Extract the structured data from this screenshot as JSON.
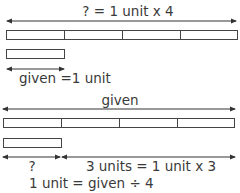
{
  "top_model": {
    "total_label": "? = 1 unit x 4",
    "units": 4,
    "unit_label": "given =1 unit"
  },
  "bottom_model": {
    "total_label": "given",
    "units": 4,
    "unknown_label": "?",
    "rest_label": "3 units = 1 unit x 3",
    "formula": "1 unit = given ÷ 4"
  },
  "colors": {
    "stroke": "#444444",
    "text": "#3a3a3a"
  }
}
